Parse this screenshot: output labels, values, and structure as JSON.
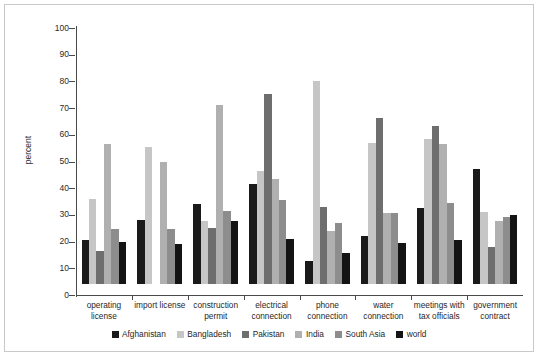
{
  "chart_data": {
    "type": "bar",
    "title": "",
    "subtitle": "",
    "xlabel": "",
    "ylabel": "percent",
    "ylim": [
      0,
      100
    ],
    "yticks": [
      0,
      10,
      20,
      30,
      40,
      50,
      60,
      70,
      80,
      90,
      100
    ],
    "grid": false,
    "legend_position": "bottom",
    "categories": [
      "operating\nlicense",
      "import license",
      "construction\npermit",
      "electrical\nconnection",
      "phone\nconnection",
      "water\nconnection",
      "meetings with\ntax officials",
      "government\ncontract"
    ],
    "series": [
      {
        "name": "Afghanistan",
        "color": "#1a1a1a",
        "values": [
          16.5,
          24.0,
          30.0,
          37.5,
          8.5,
          18.0,
          28.5,
          43.0
        ]
      },
      {
        "name": "Bangladesh",
        "color": "#c6c6c6",
        "values": [
          32.0,
          51.5,
          23.5,
          42.5,
          76.0,
          53.0,
          54.5,
          27.0
        ]
      },
      {
        "name": "Pakistan",
        "color": "#6e6e6e",
        "values": [
          12.5,
          0.0,
          21.0,
          71.0,
          29.0,
          62.0,
          59.0,
          14.0
        ]
      },
      {
        "name": "India",
        "color": "#b0b0b0",
        "values": [
          52.5,
          45.8,
          67.0,
          39.5,
          19.8,
          26.5,
          52.5,
          23.5
        ]
      },
      {
        "name": "South Asia",
        "color": "#8d8d8d",
        "values": [
          20.5,
          20.5,
          27.5,
          31.5,
          22.8,
          26.5,
          30.5,
          25.0
        ]
      },
      {
        "name": "world",
        "color": "#141414",
        "values": [
          15.7,
          15.0,
          23.7,
          16.7,
          11.8,
          15.5,
          16.5,
          26.0
        ]
      }
    ]
  }
}
